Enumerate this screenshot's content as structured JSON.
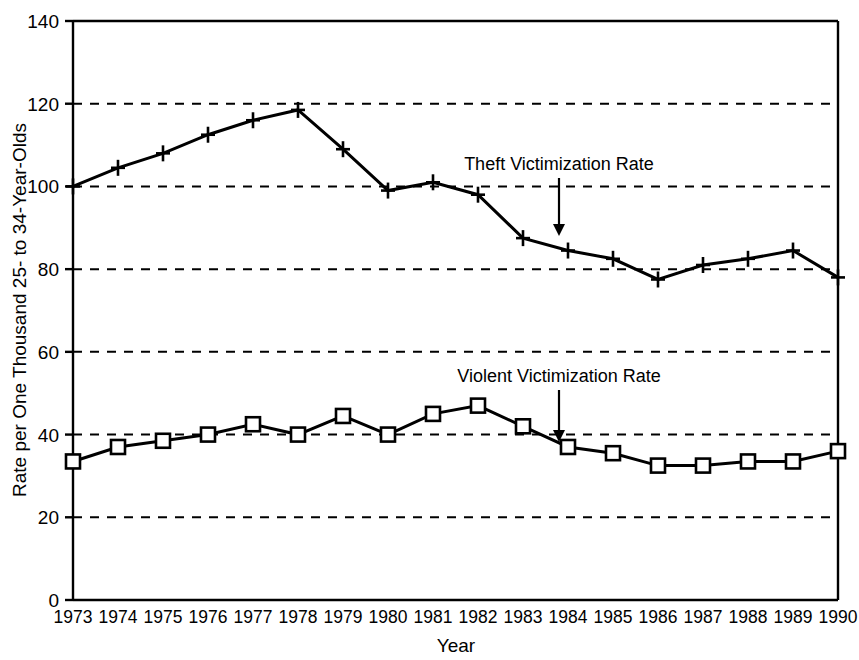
{
  "chart_data": {
    "type": "line",
    "title": "",
    "xlabel": "Year",
    "ylabel": "Rate per One Thousand 25- to 34-Year-Olds",
    "categories": [
      1973,
      1974,
      1975,
      1976,
      1977,
      1978,
      1979,
      1980,
      1981,
      1982,
      1983,
      1984,
      1985,
      1986,
      1987,
      1988,
      1989,
      1990
    ],
    "x_tick_labels": [
      "1973",
      "1974",
      "1975",
      "1976",
      "1977",
      "1978",
      "1979",
      "1980",
      "1981",
      "1982",
      "1983",
      "1984",
      "1985",
      "1986",
      "1987",
      "1988",
      "1989",
      "1990"
    ],
    "y_tick_labels": [
      "0",
      "20",
      "40",
      "60",
      "80",
      "100",
      "120",
      "140"
    ],
    "y_ticks": [
      0,
      20,
      40,
      60,
      80,
      100,
      120,
      140
    ],
    "ylim": [
      0,
      140
    ],
    "xlim": [
      1973,
      1990
    ],
    "grid": "horizontal-dashed",
    "legend_position": "inline-annotations",
    "series": [
      {
        "name": "Theft Victimization Rate",
        "marker": "plus",
        "color": "#000000",
        "values": [
          100,
          104.5,
          108,
          112.5,
          116,
          118.5,
          109,
          99,
          101,
          98,
          87.5,
          84.5,
          82.5,
          77.5,
          81,
          82.5,
          84.5,
          78
        ]
      },
      {
        "name": "Violent Victimization Rate",
        "marker": "square-open",
        "color": "#000000",
        "values": [
          33.5,
          37,
          38.5,
          40,
          42.5,
          40,
          44.5,
          40,
          45,
          47,
          42,
          37,
          35.5,
          32.5,
          32.5,
          33.5,
          33.5,
          36
        ]
      }
    ],
    "annotations": [
      {
        "text": "Theft Victimization Rate",
        "target_year": 1983,
        "label_x": 559,
        "label_y": 170,
        "arrow_from_y": 178,
        "arrow_to_y": 236
      },
      {
        "text": "Violent Victimization Rate",
        "target_year": 1983,
        "label_x": 559,
        "label_y": 382,
        "arrow_from_y": 390,
        "arrow_to_y": 442
      }
    ]
  },
  "axes": {
    "y_axis_title": "Rate per One Thousand 25- to 34-Year-Olds",
    "x_axis_title": "Year"
  },
  "page": {
    "top_fragment": ""
  }
}
